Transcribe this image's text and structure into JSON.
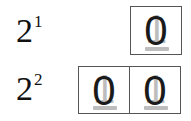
{
  "rows": [
    {
      "label_base": "2",
      "label_exponent": "1",
      "cells": [
        {
          "digit": "0",
          "ghost_digit": "1"
        }
      ]
    },
    {
      "label_base": "2",
      "label_exponent": "2",
      "cells": [
        {
          "digit": "0",
          "ghost_digit": "1"
        },
        {
          "digit": "0",
          "ghost_digit": "1"
        }
      ]
    }
  ],
  "colors": {
    "digit": "#1a1a1a",
    "ghost": "#bdbdbd",
    "border": "#555555",
    "background": "#ffffff"
  }
}
